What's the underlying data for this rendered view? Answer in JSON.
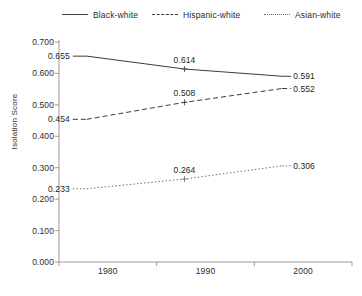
{
  "chart_data": {
    "type": "line",
    "title": "",
    "xlabel": "",
    "ylabel": "Isolation Score",
    "categories": [
      "1980",
      "1990",
      "2000"
    ],
    "ylim": [
      0.0,
      0.7
    ],
    "ytick_step": 0.1,
    "ytick_labels": [
      "0.700",
      "0.600",
      "0.500",
      "0.400",
      "0.300",
      "0.200",
      "0.100",
      "0.000"
    ],
    "ytick_values": [
      0.7,
      0.6,
      0.5,
      0.4,
      0.3,
      0.2,
      0.1,
      0.0
    ],
    "grid": false,
    "legend_position": "top",
    "series": [
      {
        "name": "Black-white",
        "style": "solid",
        "color": "#3b3b3b",
        "values": [
          0.655,
          0.614,
          0.591
        ],
        "labels": [
          "0.655",
          "0.614",
          "0.591"
        ]
      },
      {
        "name": "Hispanic-white",
        "style": "dashed",
        "color": "#3b3b3b",
        "values": [
          0.454,
          0.508,
          0.552
        ],
        "labels": [
          "0.454",
          "0.508",
          "0.552"
        ]
      },
      {
        "name": "Asian-white",
        "style": "dotted",
        "color": "#6b6b6b",
        "values": [
          0.233,
          0.264,
          0.306
        ],
        "labels": [
          "0.233",
          "0.264",
          "0.306"
        ]
      }
    ]
  },
  "legend": {
    "items": [
      {
        "label": "Black-white"
      },
      {
        "label": "Hispanic-white"
      },
      {
        "label": "Asian-white"
      }
    ]
  },
  "axes": {
    "y_title": "Isolation Score",
    "y_ticks": [
      "0.700",
      "0.600",
      "0.500",
      "0.400",
      "0.300",
      "0.200",
      "0.100",
      "0.000"
    ],
    "x_ticks": [
      "1980",
      "1990",
      "2000"
    ]
  },
  "colors": {
    "axis": "#9a9a9a",
    "text": "#231f20",
    "series_solid": "#3b3b3b",
    "series_dashed": "#3b3b3b",
    "series_dotted": "#6b6b6b",
    "background": "#ffffff"
  }
}
